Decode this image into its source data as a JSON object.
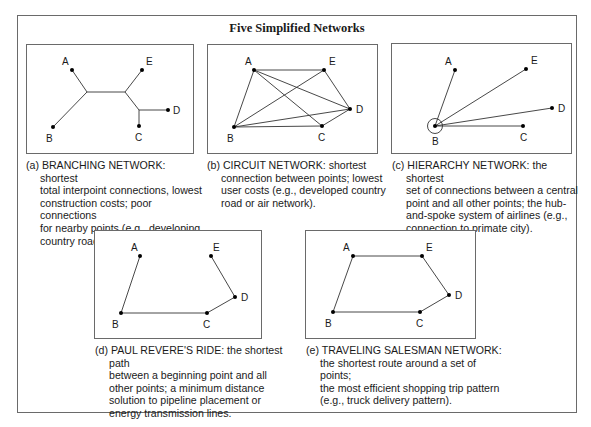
{
  "title": "Five Simplified Networks",
  "panels": [
    {
      "id": "a",
      "prefix": "(a)",
      "name": "BRANCHING NETWORK",
      "caption": "(a) BRANCHING NETWORK: shortest total interpoint connections, lowest construction costs; poor connections for nearby points (e.g., developing country road or rail system).",
      "caption_lines": [
        "(a) BRANCHING NETWORK: shortest",
        "total interpoint connections, lowest",
        "construction costs; poor connections",
        "for nearby points (e.g., developing",
        "country road or rail system)."
      ],
      "nodes": [
        "A",
        "B",
        "C",
        "D",
        "E"
      ]
    },
    {
      "id": "b",
      "prefix": "(b)",
      "name": "CIRCUIT NETWORK",
      "caption_lines": [
        "(b) CIRCUIT NETWORK: shortest",
        "connection between points; lowest",
        "user costs (e.g., developed country",
        "road or air network)."
      ],
      "nodes": [
        "A",
        "B",
        "C",
        "D",
        "E"
      ]
    },
    {
      "id": "c",
      "prefix": "(c)",
      "name": "HIERARCHY NETWORK",
      "caption_lines": [
        "(c) HIERARCHY NETWORK: the shortest",
        "set of connections between a central",
        "point and all other points; the hub-",
        "and-spoke system of airlines (e.g.,",
        "connection to primate city)."
      ],
      "nodes": [
        "A",
        "B",
        "C",
        "D",
        "E"
      ],
      "hub": "B"
    },
    {
      "id": "d",
      "prefix": "(d)",
      "name": "PAUL REVERE'S RIDE",
      "caption_lines": [
        "(d) PAUL REVERE'S RIDE: the shortest path",
        "between a beginning point and all",
        "other points; a minimum distance",
        "solution to pipeline placement or",
        "energy transmission lines."
      ],
      "nodes": [
        "A",
        "B",
        "C",
        "D",
        "E"
      ]
    },
    {
      "id": "e",
      "prefix": "(e)",
      "name": "TRAVELING SALESMAN NETWORK",
      "caption_lines": [
        "(e) TRAVELING SALESMAN NETWORK:",
        "the shortest route around a set of points;",
        "the most efficient shopping trip pattern",
        "(e.g., truck delivery pattern)."
      ],
      "nodes": [
        "A",
        "B",
        "C",
        "D",
        "E"
      ]
    }
  ]
}
